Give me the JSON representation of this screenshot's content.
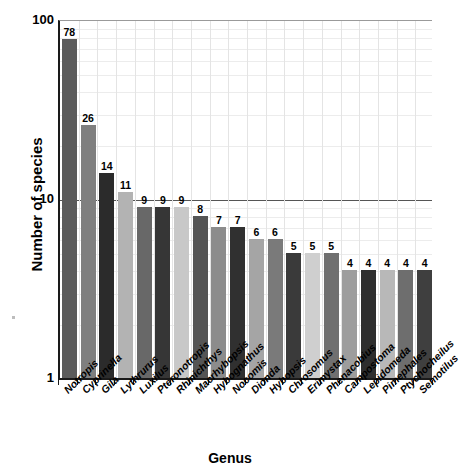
{
  "chart_data": {
    "type": "bar",
    "title": "",
    "xlabel": "Genus",
    "ylabel": "Number of species",
    "yscale": "log",
    "ylim": [
      1,
      100
    ],
    "ytick_labels": [
      "1",
      "10",
      "100"
    ],
    "ytick_values": [
      1,
      10,
      100
    ],
    "grid": true,
    "legend": "none",
    "categories": [
      "Notropis",
      "Cyprinella",
      "Gila",
      "Lythrurus",
      "Luxilus",
      "Pteronotropis",
      "Rhinichthys",
      "Macrhybopsis",
      "Hybognathus",
      "Nocomis",
      "Dionda",
      "Hybopsis",
      "Chrosomus",
      "Erimystax",
      "Phenacobius",
      "Campostoma",
      "Lepidomeda",
      "Pimephales",
      "Ptychocheilus",
      "Semotilus"
    ],
    "values": [
      78,
      26,
      14,
      11,
      9,
      9,
      9,
      8,
      7,
      7,
      6,
      6,
      5,
      5,
      5,
      4,
      4,
      4,
      4,
      4
    ],
    "value_labels": [
      "78",
      "26",
      "14",
      "11",
      "9",
      "9",
      "9",
      "8",
      "7",
      "7",
      "6",
      "6",
      "5",
      "5",
      "5",
      "4",
      "4",
      "4",
      "4",
      "4"
    ],
    "bar_colors": [
      "#5b5b5b",
      "#7f7f7f",
      "#2b2b2b",
      "#b3b3b3",
      "#686868",
      "#363636",
      "#c8c8c8",
      "#555555",
      "#8c8c8c",
      "#303030",
      "#a5a5a5",
      "#7a7a7a",
      "#3a3a3a",
      "#cfcfcf",
      "#707070",
      "#9d9d9d",
      "#2e2e2e",
      "#b8b8b8",
      "#6e6e6e",
      "#3f3f3f"
    ],
    "axis_color": "#1a1a1a",
    "grid_color": "#e4e4e4",
    "reference_line_value": 10,
    "reference_line_color": "#555555",
    "background_color": "#ffffff"
  }
}
